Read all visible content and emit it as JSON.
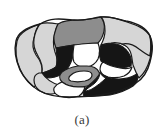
{
  "figure": {
    "caption": "(a)",
    "alt_title": "Irregular partitioned blob shape",
    "background_color": "#ffffff",
    "outline_color": "#1a1a1a",
    "outline_width": 1.2,
    "palette": {
      "light_gray": "#d6d6d6",
      "medium_gray": "#8d8d8d",
      "dark": "#151515",
      "white": "#ffffff",
      "outline": "#1a1a1a"
    },
    "regions": [
      {
        "id": "r1",
        "name": "upper-left-light-lobe",
        "fill": "#d6d6d6"
      },
      {
        "id": "r2",
        "name": "top-medium-band",
        "fill": "#8d8d8d"
      },
      {
        "id": "r3",
        "name": "top-right-light-cap",
        "fill": "#d6d6d6"
      },
      {
        "id": "r4",
        "name": "left-outer-light-wing",
        "fill": "#d6d6d6"
      },
      {
        "id": "r5",
        "name": "left-dark-block",
        "fill": "#151515"
      },
      {
        "id": "r6",
        "name": "center-white-hole",
        "fill": "#ffffff"
      },
      {
        "id": "r7",
        "name": "right-dark-block",
        "fill": "#151515"
      },
      {
        "id": "r8",
        "name": "right-light-flank",
        "fill": "#d6d6d6"
      },
      {
        "id": "r9",
        "name": "center-medium-hook",
        "fill": "#8d8d8d"
      },
      {
        "id": "r10",
        "name": "lower-white-wedge",
        "fill": "#ffffff"
      },
      {
        "id": "r11",
        "name": "bottom-light-tongue",
        "fill": "#d6d6d6"
      },
      {
        "id": "r12",
        "name": "bottom-right-dark-sweep",
        "fill": "#151515"
      },
      {
        "id": "r13",
        "name": "mid-right-white-notch",
        "fill": "#ffffff"
      },
      {
        "id": "r14",
        "name": "bottom-left-white-patch",
        "fill": "#ffffff"
      }
    ]
  }
}
